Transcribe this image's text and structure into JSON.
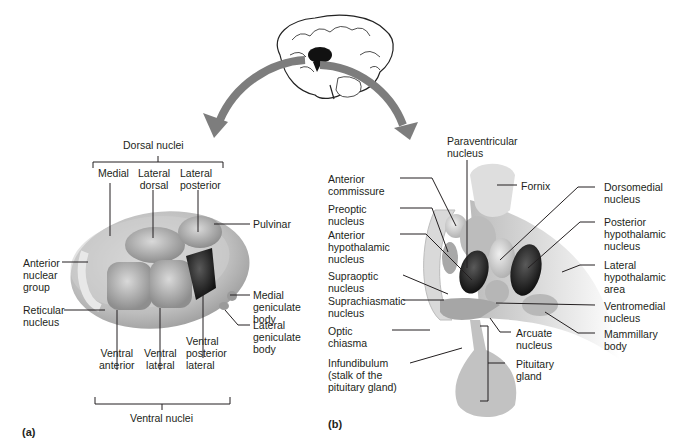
{
  "colors": {
    "arrow": "#7d7d7d",
    "structure_light": "#d8d8d8",
    "structure_mid": "#b3b3b3",
    "structure_dark": "#1a1a1a",
    "leader": "#231f20",
    "text": "#231f20"
  },
  "brain_icon": {
    "icon": "brain-sagittal-icon"
  },
  "panel_a": {
    "panel_label": "(a)",
    "dorsal_group": "Dorsal nuclei",
    "dorsal_items": [
      "Medial",
      "Lateral\ndorsal",
      "Lateral\nposterior"
    ],
    "ventral_group": "Ventral nuclei",
    "ventral_items": [
      "Ventral\nanterior",
      "Ventral\nlateral",
      "Ventral\nposterior\nlateral"
    ],
    "left_labels": [
      "Anterior\nnuclear\ngroup",
      "Reticular\nnucleus"
    ],
    "right_labels": [
      "Pulvinar",
      "Medial\ngeniculate\nbody",
      "Lateral\ngeniculate\nbody"
    ]
  },
  "panel_b": {
    "panel_label": "(b)",
    "top_label": "Paraventricular\nnucleus",
    "left_labels": [
      "Anterior\ncommissure",
      "Preoptic\nnucleus",
      "Anterior\nhypothalamic\nnucleus",
      "Supraoptic\nnucleus",
      "Suprachiasmatic\nnucleus",
      "Optic\nchiasma",
      "Infundibulum\n(stalk of the\npituitary gland)"
    ],
    "middle_labels": [
      "Fornix",
      "Arcuate\nnucleus",
      "Pituitary\ngland"
    ],
    "right_labels": [
      "Dorsomedial\nnucleus",
      "Posterior\nhypothalamic\nnucleus",
      "Lateral\nhypothalamic\narea",
      "Ventromedial\nnucleus",
      "Mammillary\nbody"
    ]
  }
}
